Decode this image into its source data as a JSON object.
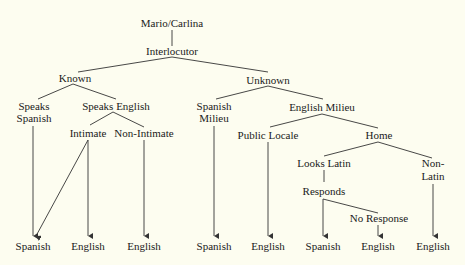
{
  "diagram": {
    "root": "Mario/Carlina",
    "level1": "Interlocutor",
    "known": {
      "label": "Known",
      "speaks_spanish": [
        "Speaks",
        "Spanish"
      ],
      "speaks_english": "Speaks English",
      "intimate": "Intimate",
      "non_intimate": "Non-Intimate"
    },
    "unknown": {
      "label": "Unknown",
      "spanish_milieu": [
        "Spanish",
        "Milieu"
      ],
      "english_milieu": "English Milieu",
      "public_locale": "Public Locale",
      "home": "Home",
      "looks_latin": "Looks Latin",
      "non_latin": [
        "Non-",
        "Latin"
      ],
      "responds": "Responds",
      "no_response": "No Response"
    },
    "outcomes": [
      "Spanish",
      "English",
      "English",
      "Spanish",
      "English",
      "Spanish",
      "English",
      "English"
    ]
  }
}
